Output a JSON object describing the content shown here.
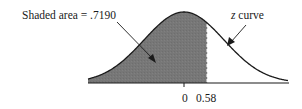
{
  "chart_data": {
    "type": "area",
    "title": "",
    "distribution": "standard normal",
    "mean": 0,
    "sd": 1,
    "shaded_region": {
      "from": "-inf",
      "to": 0.58,
      "area": 0.719
    },
    "x_ticks": [
      {
        "value": 0,
        "label": "0"
      },
      {
        "value": 0.58,
        "label": "0.58"
      }
    ],
    "annotations": [
      {
        "text_prefix": "Shaded area = ",
        "text_value": ".7190",
        "target": "shaded region"
      },
      {
        "text_italic": "z",
        "text_rest": " curve",
        "target": "curve"
      }
    ],
    "xlabel": "",
    "ylabel": "",
    "grid": false,
    "colors": {
      "shade": "#777777",
      "curve": "#1a1a1a",
      "cutoff_line": "#ffffff"
    }
  },
  "labels": {
    "shaded_prefix": "Shaded area = ",
    "shaded_value": ".7190",
    "z_letter": "z",
    "z_rest": " curve",
    "tick_zero": "0",
    "tick_cut": "0.58"
  }
}
